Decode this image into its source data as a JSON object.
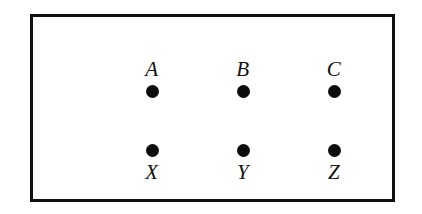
{
  "figure": {
    "type": "node-grid-diagram",
    "border_color": "#111111",
    "background_color": "#ffffff",
    "dot_color": "#0d0d0d",
    "label_color": "#121212",
    "frame": {
      "x": 30,
      "y": 14,
      "width": 365,
      "height": 188,
      "border_width": 3
    },
    "columns": 3,
    "rows": 2
  },
  "nodes": {
    "top_row": [
      {
        "label": "A",
        "dot": "filled-circle",
        "cx": 119,
        "cy": 80
      },
      {
        "label": "B",
        "dot": "filled-circle",
        "cx": 210,
        "cy": 80
      },
      {
        "label": "C",
        "dot": "filled-circle",
        "cx": 301,
        "cy": 80
      }
    ],
    "bottom_row": [
      {
        "label": "X",
        "dot": "filled-circle",
        "cx": 119,
        "cy": 134
      },
      {
        "label": "Y",
        "dot": "filled-circle",
        "cx": 210,
        "cy": 134
      },
      {
        "label": "Z",
        "dot": "filled-circle",
        "cx": 301,
        "cy": 134
      }
    ]
  }
}
